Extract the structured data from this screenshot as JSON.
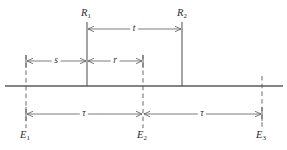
{
  "figure": {
    "type": "spacetime-interval-diagram",
    "background_color": "#ffffff",
    "line_color": "#5a5a5a",
    "text_color": "#2b2b2b"
  },
  "axis": {
    "name": "main-horizontal-line",
    "x_start": 5,
    "x_end": 283,
    "y": 86
  },
  "event_markers": [
    {
      "id": "E1",
      "label": "E",
      "subscript": "1",
      "x": 26,
      "label_y": 135,
      "style": "dashed"
    },
    {
      "id": "E2",
      "label": "E",
      "subscript": "2",
      "x": 143,
      "label_y": 135,
      "style": "dashed"
    },
    {
      "id": "E3",
      "label": "E",
      "subscript": "3",
      "x": 262,
      "label_y": 135,
      "style": "dashed"
    }
  ],
  "reference_markers": [
    {
      "id": "R1",
      "label": "R",
      "subscript": "1",
      "x": 87,
      "label_y": 13,
      "top_y": 22,
      "bottom_y": 86,
      "style": "solid"
    },
    {
      "id": "R2",
      "label": "R",
      "subscript": "2",
      "x": 182,
      "label_y": 13,
      "top_y": 22,
      "bottom_y": 86,
      "style": "solid"
    }
  ],
  "dimensions": [
    {
      "id": "t",
      "label": "t",
      "x_from": 87,
      "x_to": 182,
      "y": 29,
      "label_x": 134
    },
    {
      "id": "s",
      "label": "s",
      "x_from": 26,
      "x_to": 87,
      "y": 61,
      "label_x": 56
    },
    {
      "id": "r",
      "label": "r",
      "x_from": 87,
      "x_to": 143,
      "y": 61,
      "label_x": 115
    },
    {
      "id": "tau-1",
      "label": "τ",
      "x_from": 26,
      "x_to": 143,
      "y": 114,
      "label_x": 84
    },
    {
      "id": "tau-2",
      "label": "τ",
      "x_from": 143,
      "x_to": 262,
      "y": 114,
      "label_x": 202
    }
  ],
  "extension_ticks": [
    {
      "id": "tick-E1-upper",
      "x": 26,
      "y_top": 55,
      "y_bottom": 68
    },
    {
      "id": "tick-E2-upper",
      "x": 143,
      "y_top": 55,
      "y_bottom": 68
    },
    {
      "id": "tick-E3-lower",
      "x": 262,
      "y_top": 107,
      "y_bottom": 122
    }
  ]
}
